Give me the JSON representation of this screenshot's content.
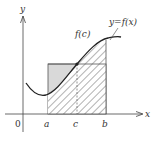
{
  "figure": {
    "title": "",
    "axes": {
      "x_label": "x",
      "y_label": "y",
      "origin_label": "0"
    },
    "ticks": {
      "a": "a",
      "c": "c",
      "b": "b"
    },
    "labels": {
      "curve": "y=f(x)",
      "point": "f(c)"
    },
    "colors": {
      "axis": "#444444",
      "curve": "#222222",
      "rect_fill": "#d9d9d9",
      "rect_stroke": "#555555",
      "hatch": "#555555"
    }
  }
}
